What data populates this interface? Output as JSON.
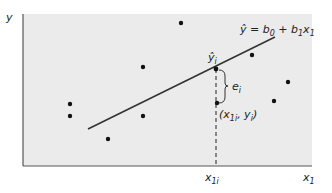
{
  "diagram": {
    "type": "regression-residual-diagram",
    "colors": {
      "plot_background": "#ebebeb",
      "axis": "#555555",
      "points": "#111111",
      "line": "#333333"
    },
    "axes": {
      "y_label": "y",
      "x_label": "x",
      "x_label_sub": "1",
      "x_tick_label": "x",
      "x_tick_sub": "1i"
    },
    "equation": {
      "lhs": "ŷ",
      "eq": " = b",
      "b0_sub": "0",
      "plus": " + b",
      "b1_sub": "1",
      "x": "x",
      "x_sub": "1"
    },
    "fitted_point_label": {
      "main": "ŷ",
      "sub": "i"
    },
    "residual_label": {
      "main": "e",
      "sub": "i"
    },
    "observed_point_label": {
      "open": "(x",
      "sub1": "1i",
      "mid": ", y",
      "sub2": "i",
      "close": ")"
    },
    "points": [
      {
        "x": 181,
        "y": 23
      },
      {
        "x": 143,
        "y": 67
      },
      {
        "x": 252,
        "y": 55
      },
      {
        "x": 288,
        "y": 82
      },
      {
        "x": 274,
        "y": 101
      },
      {
        "x": 70,
        "y": 104
      },
      {
        "x": 70,
        "y": 116
      },
      {
        "x": 143,
        "y": 116
      },
      {
        "x": 108,
        "y": 139
      },
      {
        "x": 217,
        "y": 103
      }
    ],
    "regression_line": {
      "x1": 88,
      "y1": 129,
      "x2": 275,
      "y2": 37
    },
    "fitted_point": {
      "x": 216,
      "y": 69
    }
  }
}
